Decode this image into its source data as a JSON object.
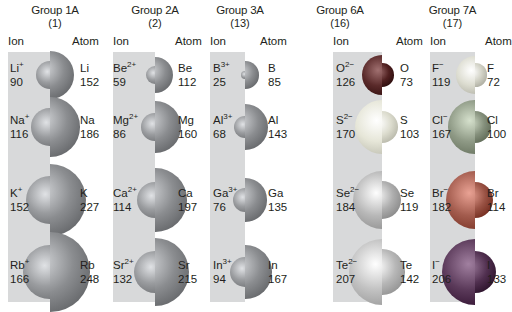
{
  "figure": {
    "column_headers": {
      "ion": "Ion",
      "atom": "Atom"
    },
    "groups": [
      {
        "name": "Group 1A",
        "number": "(1)",
        "elements": [
          {
            "ion_symbol": "Li",
            "charge": "+",
            "ion_radius": "90",
            "atom_symbol": "Li",
            "atom_radius": "152"
          },
          {
            "ion_symbol": "Na",
            "charge": "+",
            "ion_radius": "116",
            "atom_symbol": "Na",
            "atom_radius": "186"
          },
          {
            "ion_symbol": "K",
            "charge": "+",
            "ion_radius": "152",
            "atom_symbol": "K",
            "atom_radius": "227"
          },
          {
            "ion_symbol": "Rb",
            "charge": "+",
            "ion_radius": "166",
            "atom_symbol": "Rb",
            "atom_radius": "248"
          }
        ]
      },
      {
        "name": "Group 2A",
        "number": "(2)",
        "elements": [
          {
            "ion_symbol": "Be",
            "charge": "2+",
            "ion_radius": "59",
            "atom_symbol": "Be",
            "atom_radius": "112"
          },
          {
            "ion_symbol": "Mg",
            "charge": "2+",
            "ion_radius": "86",
            "atom_symbol": "Mg",
            "atom_radius": "160"
          },
          {
            "ion_symbol": "Ca",
            "charge": "2+",
            "ion_radius": "114",
            "atom_symbol": "Ca",
            "atom_radius": "197"
          },
          {
            "ion_symbol": "Sr",
            "charge": "2+",
            "ion_radius": "132",
            "atom_symbol": "Sr",
            "atom_radius": "215"
          }
        ]
      },
      {
        "name": "Group 3A",
        "number": "(13)",
        "elements": [
          {
            "ion_symbol": "B",
            "charge": "3+",
            "ion_radius": "25",
            "atom_symbol": "B",
            "atom_radius": "85"
          },
          {
            "ion_symbol": "Al",
            "charge": "3+",
            "ion_radius": "68",
            "atom_symbol": "Al",
            "atom_radius": "143"
          },
          {
            "ion_symbol": "Ga",
            "charge": "3+",
            "ion_radius": "76",
            "atom_symbol": "Ga",
            "atom_radius": "135"
          },
          {
            "ion_symbol": "In",
            "charge": "3+",
            "ion_radius": "94",
            "atom_symbol": "In",
            "atom_radius": "167"
          }
        ]
      },
      {
        "name": "Group 6A",
        "number": "(16)",
        "elements": [
          {
            "ion_symbol": "O",
            "charge": "2−",
            "ion_radius": "126",
            "atom_symbol": "O",
            "atom_radius": "73"
          },
          {
            "ion_symbol": "S",
            "charge": "2−",
            "ion_radius": "170",
            "atom_symbol": "S",
            "atom_radius": "103"
          },
          {
            "ion_symbol": "Se",
            "charge": "2−",
            "ion_radius": "184",
            "atom_symbol": "Se",
            "atom_radius": "119"
          },
          {
            "ion_symbol": "Te",
            "charge": "2−",
            "ion_radius": "207",
            "atom_symbol": "Te",
            "atom_radius": "142"
          }
        ]
      },
      {
        "name": "Group 7A",
        "number": "(17)",
        "elements": [
          {
            "ion_symbol": "F",
            "charge": "−",
            "ion_radius": "119",
            "atom_symbol": "F",
            "atom_radius": "72"
          },
          {
            "ion_symbol": "Cl",
            "charge": "−",
            "ion_radius": "167",
            "atom_symbol": "Cl",
            "atom_radius": "100"
          },
          {
            "ion_symbol": "Br",
            "charge": "−",
            "ion_radius": "182",
            "atom_symbol": "Br",
            "atom_radius": "114"
          },
          {
            "ion_symbol": "I",
            "charge": "−",
            "ion_radius": "206",
            "atom_symbol": "I",
            "atom_radius": "133"
          }
        ]
      }
    ],
    "colors": {
      "panel": "#d8d9da",
      "metal_sphere": "#9a9c9f",
      "oxygen": "#5a2a2a",
      "sulfur": "#e6e6d8",
      "selenium": "#b8b8b8",
      "tellurium": "#c2c2c2",
      "fluorine": "#dcdcd0",
      "chlorine": "#8f9a86",
      "bromine": "#a35c4e",
      "iodine": "#5b3a5a"
    }
  }
}
